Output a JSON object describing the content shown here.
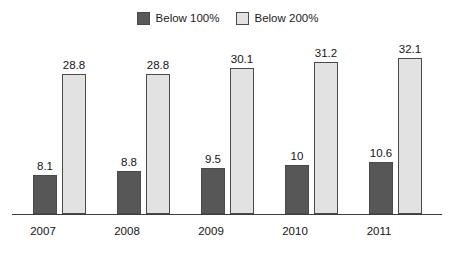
{
  "chart_data": {
    "type": "bar",
    "title": "",
    "subtitle": "",
    "xlabel": "",
    "ylabel": "",
    "categories": [
      "2007",
      "2008",
      "2009",
      "2010",
      "2011"
    ],
    "series": [
      {
        "name": "Below 100%",
        "color": "#575757",
        "values": [
          8.1,
          8.8,
          9.5,
          10,
          10.6
        ],
        "labels": [
          "8.1",
          "8.8",
          "9.5",
          "10",
          "10.6"
        ]
      },
      {
        "name": "Below 200%",
        "color": "#e2e2e2",
        "values": [
          28.8,
          28.8,
          30.1,
          31.2,
          32.1
        ],
        "labels": [
          "28.8",
          "28.8",
          "30.1",
          "31.2",
          "32.1"
        ]
      }
    ],
    "ylim": [
      0,
      32.1
    ],
    "grid": false,
    "legend_position": "top-center",
    "axis_color": "#3d3d3d",
    "bar_border_color": "#4a4a4a",
    "background_color": "#ffffff"
  },
  "legend": {
    "entries": [
      {
        "label": "Below 100%",
        "swatch": "dark-swatch-icon"
      },
      {
        "label": "Below 200%",
        "swatch": "light-swatch-icon"
      }
    ]
  }
}
